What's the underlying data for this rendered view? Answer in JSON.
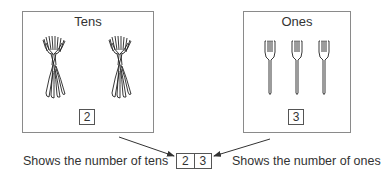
{
  "diagram": {
    "tens": {
      "title": "Tens",
      "digit": "2",
      "bundle_count": 2,
      "icon": "fork-bundle-icon",
      "caption": "Shows the number of tens"
    },
    "ones": {
      "title": "Ones",
      "digit": "3",
      "fork_count": 3,
      "icon": "fork-icon",
      "caption": "Shows the number of ones"
    },
    "result": {
      "tens_digit": "2",
      "ones_digit": "3"
    },
    "colors": {
      "border": "#8a8a8a",
      "text": "#333333",
      "arrow": "#333333"
    }
  }
}
